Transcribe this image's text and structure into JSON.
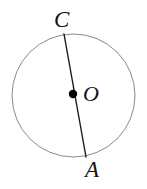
{
  "figure": {
    "type": "circle-with-diameter",
    "canvas": {
      "width": 147,
      "height": 189,
      "background": "#ffffff"
    },
    "colors": {
      "circle_stroke": "#8a8a8a",
      "chord_stroke": "#1a1a1a",
      "center_dot_fill": "#000000",
      "label_text": "#131313",
      "background": "#ffffff"
    },
    "circle": {
      "center_x": 73.5,
      "center_y": 95.5,
      "radius": 61.5,
      "stroke_width": 1
    },
    "center_point": {
      "label": "O",
      "x": 73,
      "y": 94,
      "dot_radius": 4.2
    },
    "chord": {
      "from_label": "C",
      "to_label": "A",
      "x1": 64,
      "y1": 34,
      "x2": 86,
      "y2": 157,
      "stroke_width": 1.4
    },
    "labels": [
      {
        "text": "C",
        "x": 63,
        "y": 20,
        "position": "top"
      },
      {
        "text": "O",
        "x": 91,
        "y": 94,
        "position": "center-right"
      },
      {
        "text": "A",
        "x": 95,
        "y": 170,
        "position": "bottom"
      }
    ]
  }
}
